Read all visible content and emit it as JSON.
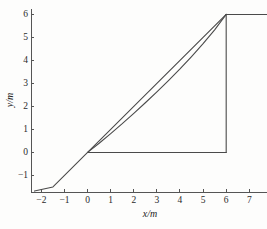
{
  "chart_data": {
    "type": "line",
    "title": "",
    "xlabel": "x/m",
    "ylabel": "y/m",
    "xlim": [
      -2.45,
      7.85
    ],
    "ylim": [
      -1.72,
      6.25
    ],
    "xticks": [
      -2,
      -1,
      0,
      1,
      2,
      3,
      4,
      5,
      6,
      7
    ],
    "xtick_labels": [
      "−2",
      "−1",
      "0",
      "1",
      "2",
      "3",
      "4",
      "5",
      "6",
      "7"
    ],
    "yticks": [
      -1,
      0,
      1,
      2,
      3,
      4,
      5,
      6
    ],
    "ytick_labels": [
      "−1",
      "0",
      "1",
      "2",
      "3",
      "4",
      "5",
      "6"
    ],
    "grid": false,
    "legend": null,
    "line_color": "#4a4a4a",
    "axis_color": "#555555",
    "background_color": "#fdfdfc",
    "series": [
      {
        "name": "straight-line",
        "comment": "straight diagonal of slope 1 through the origin, drawn from lower-left corner up to (6,6)",
        "x": [
          -2.3,
          -1.5,
          -1.0,
          -0.5,
          0.0,
          1.0,
          2.0,
          3.0,
          4.0,
          5.0,
          6.0
        ],
        "y": [
          -1.68,
          -1.5,
          -1.0,
          -0.5,
          0.0,
          1.0,
          2.0,
          3.0,
          4.0,
          5.0,
          6.0
        ]
      },
      {
        "name": "curved-line",
        "comment": "slightly concave-up curve from the origin rising to (6,6), sagging below the straight line in the middle",
        "x": [
          0.0,
          0.5,
          1.0,
          1.5,
          2.0,
          2.5,
          3.0,
          3.5,
          4.0,
          4.5,
          5.0,
          5.5,
          6.0
        ],
        "y": [
          0.0,
          0.4,
          0.82,
          1.25,
          1.7,
          2.16,
          2.63,
          3.12,
          3.63,
          4.17,
          4.73,
          5.33,
          6.0
        ]
      },
      {
        "name": "baseline-segment",
        "comment": "horizontal segment at y = 0 from x = 0 to x = 6",
        "x": [
          0.0,
          6.0
        ],
        "y": [
          0.0,
          0.0
        ]
      },
      {
        "name": "vertical-segment",
        "comment": "vertical segment at x = 6 from y = 0 up to y = 6",
        "x": [
          6.0,
          6.0
        ],
        "y": [
          0.0,
          6.0
        ]
      },
      {
        "name": "top-plateau-segment",
        "comment": "horizontal segment at y = 6 from x = 6 to the right edge of the plot",
        "x": [
          6.0,
          7.85
        ],
        "y": [
          6.0,
          6.0
        ]
      }
    ]
  }
}
